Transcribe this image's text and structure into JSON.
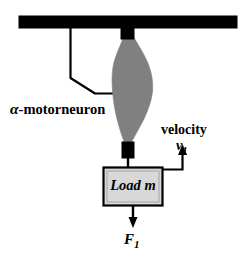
{
  "figure": {
    "colors": {
      "stroke": "#000000",
      "muscle_fill": "#808080",
      "load_fill": "#d8d8d8",
      "background": "#ffffff"
    },
    "labels": {
      "motorneuron_symbol": "α",
      "motorneuron_text": "-motorneuron",
      "velocity": "velocity",
      "velocity_symbol": "v",
      "velocity_subscript": "1",
      "load": "Load m",
      "force_symbol": "F",
      "force_subscript": "1"
    },
    "parts": {
      "ceiling_bar": "ceiling-support-bar",
      "upper_tendon": "upper-tendon",
      "muscle": "muscle-belly",
      "lower_tendon": "lower-tendon",
      "axon": "motorneuron-axon",
      "load_block": "load-block",
      "velocity_arrow": "velocity-arrow",
      "force_arrow": "force-arrow"
    }
  }
}
